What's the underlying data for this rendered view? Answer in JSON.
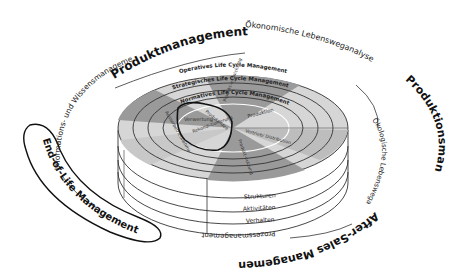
{
  "outer_labels": {
    "top": "Produktmanagement",
    "right": "Produktionsmanagement",
    "bottom_right": "After-Sales Management",
    "bottom_left": "End-of-Life Management"
  },
  "middle_labels": {
    "top_right": "Ökonomische Lebensweganalyse",
    "right": "Ökologische Lebensweganalyse",
    "left": "Informations- und Wissensmanagement",
    "bottom": "Prozessmanagement"
  },
  "rings": {
    "outer": "Operatives Life Cycle Management",
    "middle": "Strategisches Life Cycle Management",
    "inner": "Normatives Life Cycle Management"
  },
  "wedges": [
    {
      "label": "Produkt-idee"
    },
    {
      "label": "Produkt-entwicklung"
    },
    {
      "label": "Produktion"
    },
    {
      "label": "Vertrieb/ Distribution"
    },
    {
      "label": "Produkt-nutzung"
    },
    {
      "label": "Rekondi-tionierung"
    },
    {
      "label": "Verwertung"
    },
    {
      "label": "Ausserbetriebnahme"
    }
  ],
  "layers": [
    "Strukturen",
    "Aktivitäten",
    "Verhalten"
  ],
  "colors": {
    "dark_wedge": "#9a9a9a",
    "light_wedge": "#d6d6d6",
    "mid_wedge": "#bdbdbd",
    "line": "#222222"
  }
}
